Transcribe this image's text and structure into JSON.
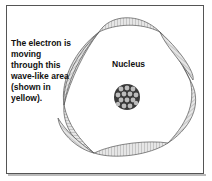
{
  "figure": {
    "caption": "The electron is moving through this wave-like area (shown in yellow).",
    "nucleus_label": "Nucleus"
  },
  "colors": {
    "frame": "#555555",
    "wave_fill": "#e0e0e0",
    "wave_stroke": "#666666",
    "nucleus_dark": "#3a3a3a",
    "nucleus_light": "#cfcfcf"
  },
  "icons": {
    "nucleus": "nucleus-icon",
    "wave": "electron-wave-icon"
  }
}
